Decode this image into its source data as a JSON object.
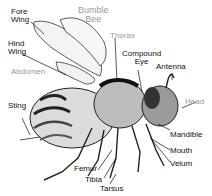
{
  "title": {
    "line1": "Bumble",
    "line2": "Bee"
  },
  "labels": {
    "fore_wing": {
      "line1": "Fore",
      "line2": "Wing"
    },
    "hind_wing": {
      "line1": "Hind",
      "line2": "Wing"
    },
    "abdomen": "Abdomen",
    "thorax": "Thorax",
    "compound_eye": {
      "line1": "Compound",
      "line2": "Eye"
    },
    "antenna": "Antenna",
    "head": "Head",
    "sting": "Sting",
    "mandible": "Mandible",
    "mouth": "Mouth",
    "velum": "Velum",
    "femur": "Femur",
    "tibia": "Tibia",
    "tarsus": "Tarsus"
  },
  "colors": {
    "primary_label": "#111111",
    "secondary_label": "#9a9a9a",
    "line_art": "#1a1a1a"
  }
}
